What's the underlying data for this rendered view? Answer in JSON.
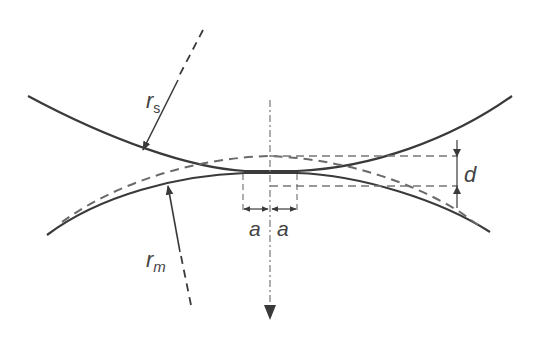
{
  "diagram": {
    "labels": {
      "rs_main": "r",
      "rs_sub": "s",
      "rm_main": "r",
      "rm_sub": "m",
      "a_left": "a",
      "a_right": "a",
      "d": "d"
    },
    "colors": {
      "stroke": "#3a3a3a",
      "dashed": "#6a6a6a",
      "background": "#ffffff"
    }
  }
}
